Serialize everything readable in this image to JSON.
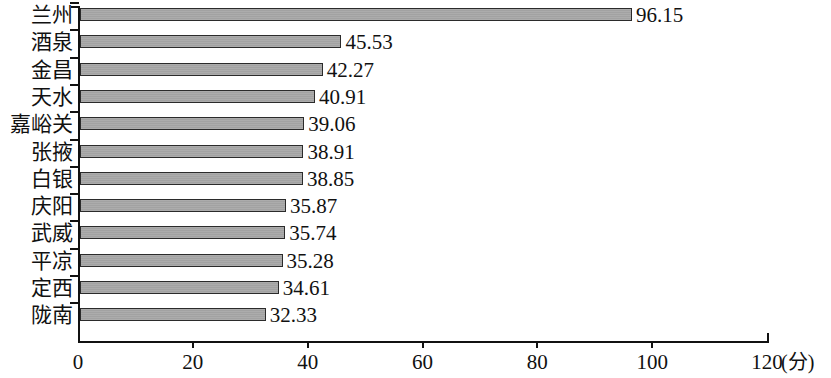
{
  "chart_data": {
    "type": "bar",
    "orientation": "horizontal",
    "title": "",
    "subtitle": "",
    "xlabel": "(分)",
    "ylabel": "",
    "xlim": [
      0,
      120
    ],
    "ylim": null,
    "grid": false,
    "legend": null,
    "legend_position": "none",
    "x_tick_labels": [
      "0",
      "20",
      "40",
      "60",
      "80",
      "100",
      "120"
    ],
    "x_tick_values": [
      0,
      20,
      40,
      60,
      80,
      100,
      120
    ],
    "x_unit": "(分)",
    "categories": [
      "兰州",
      "酒泉",
      "金昌",
      "天水",
      "嘉峪关",
      "张掖",
      "白银",
      "庆阳",
      "武威",
      "平凉",
      "定西",
      "陇南"
    ],
    "values": [
      96.15,
      45.53,
      42.27,
      40.91,
      39.06,
      38.91,
      38.85,
      35.87,
      35.74,
      35.28,
      34.61,
      32.33
    ],
    "data_labels": [
      "96.15",
      "45.53",
      "42.27",
      "40.91",
      "39.06",
      "38.91",
      "38.85",
      "35.87",
      "35.74",
      "35.28",
      "34.61",
      "32.33"
    ],
    "bars": [
      {
        "category": "兰州",
        "value": 96.15,
        "label": "96.15"
      },
      {
        "category": "酒泉",
        "value": 45.53,
        "label": "45.53"
      },
      {
        "category": "金昌",
        "value": 42.27,
        "label": "42.27"
      },
      {
        "category": "天水",
        "value": 40.91,
        "label": "40.91"
      },
      {
        "category": "嘉峪关",
        "value": 39.06,
        "label": "39.06"
      },
      {
        "category": "张掖",
        "value": 38.91,
        "label": "38.91"
      },
      {
        "category": "白银",
        "value": 38.85,
        "label": "38.85"
      },
      {
        "category": "庆阳",
        "value": 35.87,
        "label": "35.87"
      },
      {
        "category": "武威",
        "value": 35.74,
        "label": "35.74"
      },
      {
        "category": "平凉",
        "value": 35.28,
        "label": "35.28"
      },
      {
        "category": "定西",
        "value": 34.61,
        "label": "34.61"
      },
      {
        "category": "陇南",
        "value": 32.33,
        "label": "32.33"
      }
    ],
    "colors": {
      "bar_fill": "#a8a8a8",
      "bar_border": "#2b2b2b",
      "axis": "#111111",
      "text": "#111111",
      "background": "#ffffff"
    }
  }
}
